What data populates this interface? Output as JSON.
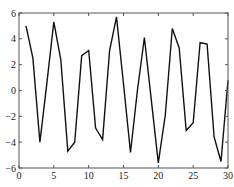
{
  "chart_data": {
    "type": "line",
    "title": "",
    "xlabel": "",
    "ylabel": "",
    "xlim": [
      0,
      30
    ],
    "ylim": [
      -6,
      6
    ],
    "grid": false,
    "legend": null,
    "x_ticks": [
      "0",
      "5",
      "10",
      "15",
      "20",
      "25",
      "30"
    ],
    "y_ticks": [
      "-6",
      "-4",
      "-2",
      "0",
      "2",
      "4",
      "6"
    ],
    "series": [
      {
        "name": "series-1",
        "color": "#111111",
        "x": [
          1,
          2,
          3,
          4,
          5,
          6,
          7,
          8,
          9,
          10,
          11,
          12,
          13,
          14,
          15,
          16,
          17,
          18,
          19,
          20,
          21,
          22,
          23,
          24,
          25,
          26,
          27,
          28,
          29,
          30
        ],
        "values": [
          5.0,
          2.5,
          -4.0,
          0.6,
          5.3,
          2.4,
          -4.7,
          -4.0,
          2.7,
          3.1,
          -2.9,
          -3.8,
          3.1,
          5.7,
          0.5,
          -4.8,
          0.0,
          4.1,
          -0.8,
          -5.6,
          -1.9,
          4.8,
          3.3,
          -3.1,
          -2.5,
          3.7,
          3.6,
          -3.6,
          -5.5,
          0.8
        ]
      }
    ]
  }
}
